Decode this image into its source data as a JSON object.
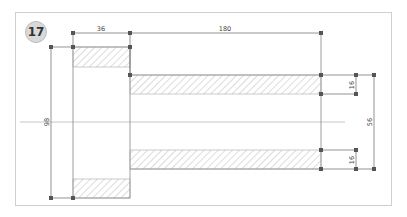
{
  "figure": {
    "number": "17",
    "type": "technical-section-drawing",
    "dimensions": {
      "flange_width": "36",
      "hub_length": "180",
      "flange_diameter": "98",
      "hub_outer_diameter": "56",
      "wall_top": "16",
      "wall_bottom": "16"
    }
  },
  "colors": {
    "line": "#6a6a6a",
    "hatch": "#a8a8a8",
    "centerline": "#b0b0b0",
    "point": "#555555",
    "frame": "#cfcfcf"
  }
}
